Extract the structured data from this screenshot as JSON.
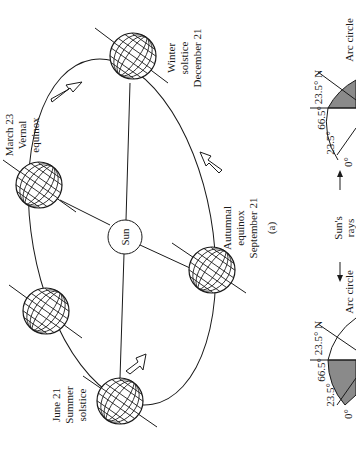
{
  "figure_label": "(a)",
  "sun": {
    "label": "Sun"
  },
  "positions": [
    {
      "id": "winter",
      "line1": "Winter",
      "line2": "solstice",
      "line3": "December 21"
    },
    {
      "id": "vernal",
      "line1": "March 23",
      "line2": "Vernal",
      "line3": "equinox"
    },
    {
      "id": "autumnal",
      "line1": "Autumnal",
      "line2": "equinox",
      "line3": "September 21"
    },
    {
      "id": "summer",
      "line1": "June 21",
      "line2": "Summer",
      "line3": "solstice"
    }
  ],
  "panel_b": {
    "sun_rays": {
      "line1": "Sun's",
      "line2": "rays"
    },
    "top": {
      "arc_circle": "Arc circle",
      "lat_n": "23.5° N",
      "lat_66": "66.5°",
      "lat_23": "23.5°",
      "lat_0": "0°"
    },
    "bottom": {
      "arc_circle": "Arc circle",
      "lat_n": "23.5° N",
      "lat_66": "66.5°",
      "lat_23": "23.5°",
      "lat_0": "0°"
    }
  },
  "colors": {
    "ink": "#1a1a1a",
    "shade": "#8a8a8a",
    "background": "#ffffff"
  }
}
